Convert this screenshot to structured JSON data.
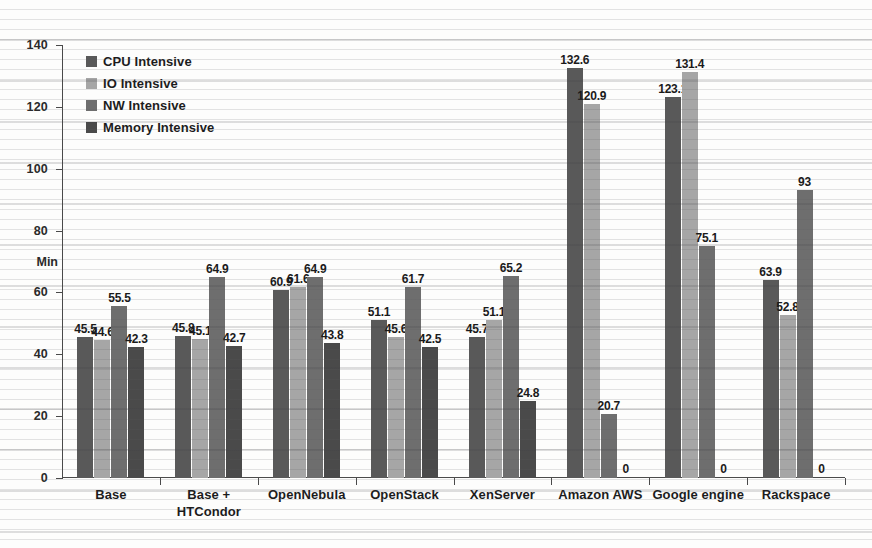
{
  "chart_data": {
    "type": "bar",
    "title": "",
    "xlabel": "",
    "ylabel": "Min",
    "ylim": [
      0,
      140
    ],
    "ytick_step": 20,
    "yticks": [
      "0",
      "20",
      "40",
      "60",
      "80",
      "100",
      "120",
      "140"
    ],
    "grid": false,
    "legend_position": "top-left",
    "categories": [
      "Base",
      "Base + HTCondor",
      "OpenNebula",
      "OpenStack",
      "XenServer",
      "Amazon AWS",
      "Google engine",
      "Rackspace"
    ],
    "category_lines": [
      [
        "Base"
      ],
      [
        "Base +",
        "HTCondor"
      ],
      [
        "OpenNebula"
      ],
      [
        "OpenStack"
      ],
      [
        "XenServer"
      ],
      [
        "Amazon AWS"
      ],
      [
        "Google engine"
      ],
      [
        "Rackspace"
      ]
    ],
    "series": [
      {
        "name": "CPU Intensive",
        "color": "#595959",
        "values": [
          45.5,
          45.8,
          60.9,
          51.1,
          45.7,
          132.6,
          123.1,
          63.9
        ],
        "labels": [
          "45.5",
          "45.8",
          "60.9",
          "51.1",
          "45.7",
          "132.6",
          "123.1",
          "63.9"
        ]
      },
      {
        "name": "IO Intensive",
        "color": "#a6a6a6",
        "values": [
          44.6,
          45.1,
          61.6,
          45.6,
          51.1,
          120.9,
          131.4,
          52.8
        ],
        "labels": [
          "44.6",
          "45.1",
          "61.6",
          "45.6",
          "51.1",
          "120.9",
          "131.4",
          "52.8"
        ]
      },
      {
        "name": "NW Intensive",
        "color": "#6e6e6e",
        "values": [
          55.5,
          64.9,
          64.9,
          61.7,
          65.2,
          20.7,
          75.1,
          93
        ],
        "labels": [
          "55.5",
          "64.9",
          "64.9",
          "61.7",
          "65.2",
          "20.7",
          "75.1",
          "93"
        ]
      },
      {
        "name": "Memory Intensive",
        "color": "#4a4a4a",
        "values": [
          42.3,
          42.7,
          43.8,
          42.5,
          24.8,
          0,
          0,
          0
        ],
        "labels": [
          "42.3",
          "42.7",
          "43.8",
          "42.5",
          "24.8",
          "0",
          "0",
          "0"
        ]
      }
    ]
  }
}
